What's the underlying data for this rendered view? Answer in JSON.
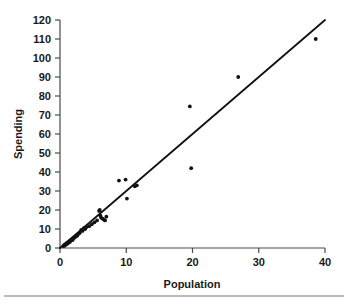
{
  "chart_data": {
    "type": "scatter",
    "title": "",
    "xlabel": "Population",
    "ylabel": "Spending",
    "xlim": [
      0,
      40
    ],
    "ylim": [
      0,
      120
    ],
    "xticks": [
      0,
      10,
      20,
      30,
      40
    ],
    "yticks": [
      0,
      10,
      20,
      30,
      40,
      50,
      60,
      70,
      80,
      90,
      100,
      110,
      120
    ],
    "grid": false,
    "legend": null,
    "series": [
      {
        "name": "Spending vs Population",
        "marker": "filled-circle",
        "color": "#111111",
        "points": [
          [
            0.5,
            1.0
          ],
          [
            0.6,
            1.5
          ],
          [
            0.7,
            1.2
          ],
          [
            0.8,
            2.0
          ],
          [
            0.9,
            1.8
          ],
          [
            1.0,
            2.5
          ],
          [
            1.1,
            2.2
          ],
          [
            1.2,
            3.0
          ],
          [
            1.3,
            2.8
          ],
          [
            1.4,
            3.5
          ],
          [
            1.5,
            3.2
          ],
          [
            1.6,
            4.0
          ],
          [
            1.8,
            4.5
          ],
          [
            1.9,
            4.2
          ],
          [
            2.0,
            5.0
          ],
          [
            2.2,
            5.5
          ],
          [
            2.4,
            6.0
          ],
          [
            2.6,
            6.5
          ],
          [
            2.8,
            7.5
          ],
          [
            3.0,
            8.0
          ],
          [
            3.2,
            9.5
          ],
          [
            3.4,
            9.0
          ],
          [
            3.6,
            10.5
          ],
          [
            3.8,
            10.0
          ],
          [
            4.0,
            11.0
          ],
          [
            4.4,
            11.5
          ],
          [
            4.8,
            12.5
          ],
          [
            5.2,
            13.5
          ],
          [
            5.6,
            14.5
          ],
          [
            5.9,
            19.5
          ],
          [
            6.0,
            20.0
          ],
          [
            6.1,
            17.0
          ],
          [
            6.2,
            16.0
          ],
          [
            6.4,
            15.5
          ],
          [
            6.6,
            15.0
          ],
          [
            6.8,
            14.5
          ],
          [
            7.0,
            16.5
          ],
          [
            8.9,
            35.5
          ],
          [
            9.9,
            36.0
          ],
          [
            10.1,
            26.0
          ],
          [
            11.3,
            32.5
          ],
          [
            11.6,
            33.0
          ],
          [
            19.6,
            74.5
          ],
          [
            19.8,
            42.0
          ],
          [
            26.9,
            90.0
          ],
          [
            38.6,
            110.0
          ]
        ]
      }
    ],
    "fit_line": {
      "name": "regression-line",
      "color": "#111111",
      "x0": 0,
      "y0": 0,
      "x1": 40,
      "y1": 120
    }
  },
  "axes": {
    "x_title": "Population",
    "y_title": "Spending",
    "x_tick_labels": [
      "0",
      "10",
      "20",
      "30",
      "40"
    ],
    "y_tick_labels": [
      "0",
      "10",
      "20",
      "30",
      "40",
      "50",
      "60",
      "70",
      "80",
      "90",
      "100",
      "110",
      "120"
    ]
  }
}
